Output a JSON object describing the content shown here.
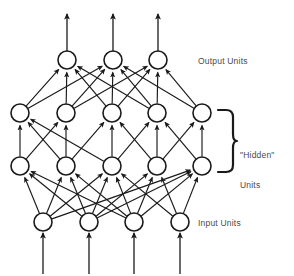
{
  "figure": {
    "type": "diagram",
    "background_color": "#ffffff",
    "stroke_color": "#1a1a1a",
    "node_fill_color": "#ffffff",
    "text_color": "#4a4a4a"
  },
  "labels": {
    "output": "Output Units",
    "hidden_line1": "\"Hidden\"",
    "hidden_line2": "Units",
    "input": "Input Units"
  },
  "network": {
    "node_radius": 9,
    "layers": [
      {
        "id": "output",
        "name": "Output Units",
        "count": 3,
        "y": 60,
        "x": [
          67,
          113,
          158
        ]
      },
      {
        "id": "hidden2",
        "name": "Hidden Layer 2",
        "count": 5,
        "y": 113,
        "x": [
          20,
          66,
          112,
          157,
          202
        ]
      },
      {
        "id": "hidden1",
        "name": "Hidden Layer 1",
        "count": 5,
        "y": 166,
        "x": [
          20,
          66,
          112,
          157,
          202
        ]
      },
      {
        "id": "input",
        "name": "Input Units",
        "count": 4,
        "y": 222,
        "x": [
          43,
          89,
          134,
          180
        ]
      }
    ],
    "external_arrows": {
      "outputs": {
        "count": 3,
        "x": [
          67,
          113,
          158
        ],
        "from_y": 51,
        "to_y": 14
      },
      "inputs": {
        "count": 4,
        "x": [
          43,
          89,
          134,
          180
        ],
        "from_y": 274,
        "to_y": 233
      }
    },
    "edges": [
      {
        "from": "hidden2",
        "fi": 0,
        "to": "output",
        "ti": 0
      },
      {
        "from": "hidden2",
        "fi": 0,
        "to": "output",
        "ti": 1
      },
      {
        "from": "hidden2",
        "fi": 1,
        "to": "output",
        "ti": 0
      },
      {
        "from": "hidden2",
        "fi": 1,
        "to": "output",
        "ti": 1
      },
      {
        "from": "hidden2",
        "fi": 1,
        "to": "output",
        "ti": 2
      },
      {
        "from": "hidden2",
        "fi": 2,
        "to": "output",
        "ti": 0
      },
      {
        "from": "hidden2",
        "fi": 2,
        "to": "output",
        "ti": 1
      },
      {
        "from": "hidden2",
        "fi": 2,
        "to": "output",
        "ti": 2
      },
      {
        "from": "hidden2",
        "fi": 3,
        "to": "output",
        "ti": 0
      },
      {
        "from": "hidden2",
        "fi": 3,
        "to": "output",
        "ti": 1
      },
      {
        "from": "hidden2",
        "fi": 3,
        "to": "output",
        "ti": 2
      },
      {
        "from": "hidden2",
        "fi": 4,
        "to": "output",
        "ti": 1
      },
      {
        "from": "hidden2",
        "fi": 4,
        "to": "output",
        "ti": 2
      },
      {
        "from": "hidden1",
        "fi": 0,
        "to": "hidden2",
        "ti": 0
      },
      {
        "from": "hidden1",
        "fi": 0,
        "to": "hidden2",
        "ti": 1
      },
      {
        "from": "hidden1",
        "fi": 1,
        "to": "hidden2",
        "ti": 0
      },
      {
        "from": "hidden1",
        "fi": 1,
        "to": "hidden2",
        "ti": 1
      },
      {
        "from": "hidden1",
        "fi": 1,
        "to": "hidden2",
        "ti": 2
      },
      {
        "from": "hidden1",
        "fi": 2,
        "to": "hidden2",
        "ti": 0
      },
      {
        "from": "hidden1",
        "fi": 2,
        "to": "hidden2",
        "ti": 2
      },
      {
        "from": "hidden1",
        "fi": 2,
        "to": "hidden2",
        "ti": 3
      },
      {
        "from": "hidden1",
        "fi": 3,
        "to": "hidden2",
        "ti": 2
      },
      {
        "from": "hidden1",
        "fi": 3,
        "to": "hidden2",
        "ti": 3
      },
      {
        "from": "hidden1",
        "fi": 3,
        "to": "hidden2",
        "ti": 4
      },
      {
        "from": "hidden1",
        "fi": 4,
        "to": "hidden2",
        "ti": 3
      },
      {
        "from": "hidden1",
        "fi": 4,
        "to": "hidden2",
        "ti": 4
      },
      {
        "from": "input",
        "fi": 0,
        "to": "hidden1",
        "ti": 0
      },
      {
        "from": "input",
        "fi": 0,
        "to": "hidden1",
        "ti": 1
      },
      {
        "from": "input",
        "fi": 0,
        "to": "hidden1",
        "ti": 2
      },
      {
        "from": "input",
        "fi": 0,
        "to": "hidden1",
        "ti": 4
      },
      {
        "from": "input",
        "fi": 1,
        "to": "hidden1",
        "ti": 0
      },
      {
        "from": "input",
        "fi": 1,
        "to": "hidden1",
        "ti": 1
      },
      {
        "from": "input",
        "fi": 1,
        "to": "hidden1",
        "ti": 2
      },
      {
        "from": "input",
        "fi": 1,
        "to": "hidden1",
        "ti": 3
      },
      {
        "from": "input",
        "fi": 1,
        "to": "hidden1",
        "ti": 4
      },
      {
        "from": "input",
        "fi": 2,
        "to": "hidden1",
        "ti": 0
      },
      {
        "from": "input",
        "fi": 2,
        "to": "hidden1",
        "ti": 1
      },
      {
        "from": "input",
        "fi": 2,
        "to": "hidden1",
        "ti": 2
      },
      {
        "from": "input",
        "fi": 2,
        "to": "hidden1",
        "ti": 3
      },
      {
        "from": "input",
        "fi": 2,
        "to": "hidden1",
        "ti": 4
      },
      {
        "from": "input",
        "fi": 3,
        "to": "hidden1",
        "ti": 2
      },
      {
        "from": "input",
        "fi": 3,
        "to": "hidden1",
        "ti": 3
      },
      {
        "from": "input",
        "fi": 3,
        "to": "hidden1",
        "ti": 4
      }
    ],
    "brace": {
      "x_left": 218,
      "x_right": 233,
      "y_top": 110,
      "y_bottom": 172,
      "spans": [
        "hidden1",
        "hidden2"
      ]
    }
  }
}
